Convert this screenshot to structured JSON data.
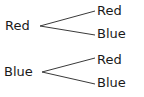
{
  "diagram": {
    "type": "tree-diagram",
    "background_color": "#ffffff",
    "line_color": "#3a3a3a",
    "text_color": "#1a1a1a",
    "line_width": 1,
    "parents": [
      {
        "id": "parent-red",
        "label": "Red",
        "x": 40,
        "y": 26
      },
      {
        "id": "parent-blue",
        "label": "Blue",
        "x": 42,
        "y": 72
      }
    ],
    "children": [
      {
        "id": "child-red-1",
        "label": "Red",
        "parent": "parent-red",
        "x": 95,
        "y": 11
      },
      {
        "id": "child-blue-1",
        "label": "Blue",
        "parent": "parent-red",
        "x": 95,
        "y": 35
      },
      {
        "id": "child-red-2",
        "label": "Red",
        "parent": "parent-blue",
        "x": 95,
        "y": 58
      },
      {
        "id": "child-blue-2",
        "label": "Blue",
        "parent": "parent-blue",
        "x": 95,
        "y": 84
      }
    ],
    "branches": [
      {
        "id": "branch-red-red",
        "from": "parent-red",
        "to": "child-red-1",
        "x1": 40,
        "y1": 26,
        "x2": 95,
        "y2": 11
      },
      {
        "id": "branch-red-blue",
        "from": "parent-red",
        "to": "child-blue-1",
        "x1": 40,
        "y1": 26,
        "x2": 95,
        "y2": 35
      },
      {
        "id": "branch-blue-red",
        "from": "parent-blue",
        "to": "child-red-2",
        "x1": 42,
        "y1": 72,
        "x2": 95,
        "y2": 58
      },
      {
        "id": "branch-blue-blue",
        "from": "parent-blue",
        "to": "child-blue-2",
        "x1": 42,
        "y1": 72,
        "x2": 95,
        "y2": 84
      }
    ]
  }
}
